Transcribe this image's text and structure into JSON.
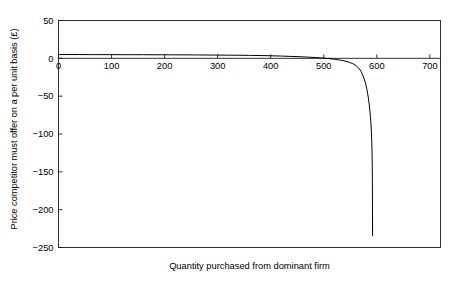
{
  "chart_data": {
    "type": "line",
    "title": "",
    "xlabel": "Quantity purchased from dominant firm",
    "ylabel": "Price competitor must offer on a per unit basis (£)",
    "xlim": [
      0,
      720
    ],
    "ylim": [
      -250,
      50
    ],
    "xticks": [
      0,
      100,
      200,
      300,
      400,
      500,
      600,
      700
    ],
    "xticklabels": [
      "0",
      "100",
      "200",
      "300",
      "400",
      "500",
      "600",
      "700"
    ],
    "yticks": [
      50,
      0,
      -50,
      -100,
      -150,
      -200,
      -250
    ],
    "yticklabels": [
      "50",
      "0",
      "−50",
      "−100",
      "−150",
      "−200",
      "−250"
    ],
    "grid": false,
    "legend": null,
    "zero_reference_line": 0,
    "series": [
      {
        "name": "Price competitor must offer",
        "color": "#000000",
        "x": [
          0,
          20,
          40,
          60,
          80,
          100,
          120,
          140,
          160,
          180,
          200,
          220,
          240,
          260,
          280,
          300,
          320,
          340,
          360,
          380,
          400,
          420,
          440,
          455,
          470,
          485,
          500,
          510,
          520,
          530,
          540,
          548,
          555,
          561,
          566,
          570,
          574,
          578,
          581,
          584,
          586,
          588,
          589,
          590,
          590.5,
          591,
          591.3,
          591.6,
          591.8,
          592
        ],
        "y": [
          5,
          5,
          5,
          4.9,
          4.9,
          4.9,
          4.8,
          4.8,
          4.8,
          4.7,
          4.7,
          4.6,
          4.6,
          4.5,
          4.4,
          4.3,
          4.2,
          4.1,
          3.9,
          3.7,
          3.4,
          3.0,
          2.5,
          2.1,
          1.6,
          1.0,
          0.2,
          -0.4,
          -1.2,
          -2.2,
          -3.6,
          -5.2,
          -7.2,
          -9.8,
          -13.0,
          -17.0,
          -23.0,
          -31.0,
          -40.0,
          -52.0,
          -63.0,
          -78.0,
          -88.0,
          -101.0,
          -110.0,
          -125.0,
          -140.0,
          -163.0,
          -195.0,
          -235.0
        ]
      }
    ]
  },
  "axis": {
    "x_title": "Quantity purchased from dominant firm",
    "y_title": "Price competitor must offer on a per unit basis (£)"
  }
}
